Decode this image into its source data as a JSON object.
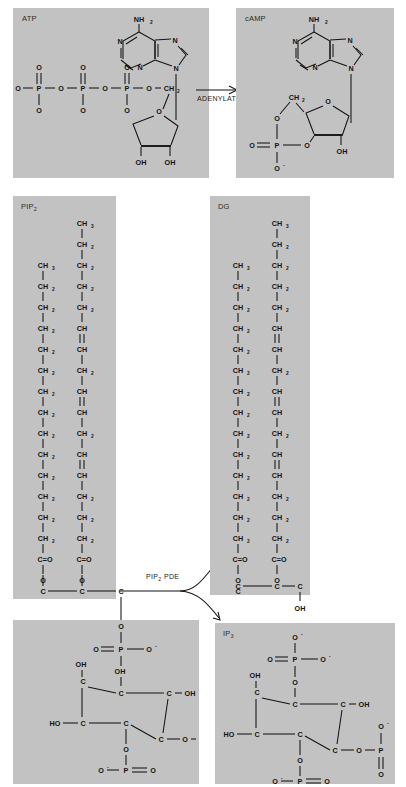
{
  "figure": {
    "background_color": "#ffffff",
    "panel_color": "#c2c2c2",
    "ink_color": "#131313"
  },
  "panels": [
    {
      "id": "atp",
      "label": "ATP",
      "label_sub": "",
      "molecule": "adenosine triphosphate"
    },
    {
      "id": "camp",
      "label": "cAMP",
      "label_sub": "",
      "molecule": "cyclic adenosine monophosphate"
    },
    {
      "id": "pip2",
      "label": "PIP",
      "label_sub": "2",
      "molecule": "phosphatidylinositol 4,5-bisphosphate"
    },
    {
      "id": "dg",
      "label": "DG",
      "label_sub": "",
      "molecule": "diacylglycerol"
    },
    {
      "id": "ip3",
      "label": "IP",
      "label_sub": "3",
      "molecule": "inositol 1,4,5-trisphosphate"
    }
  ],
  "reactions": [
    {
      "id": "cyclase",
      "enzyme": "ADENYLATE CYCLASE",
      "enzyme_sub": "",
      "arrow": "straight",
      "from": "ATP",
      "to": "cAMP"
    },
    {
      "id": "pde",
      "enzyme_pre": "PIP",
      "enzyme_sub": "2",
      "enzyme_post": " PDE",
      "arrow": "branched",
      "from": "PIP2",
      "to": "DG + IP3"
    }
  ],
  "atoms": {
    "nh2": "NH",
    "nh2_sub": "2",
    "n": "N",
    "o": "O",
    "p": "P",
    "c": "C",
    "oh": "OH",
    "ho": "HO",
    "ch2": "CH",
    "ch2_sub": "2",
    "ch3": "CH",
    "ch3_sub": "3",
    "ch": "CH",
    "co": "C=O",
    "o_minus": "O",
    "minus": "-"
  },
  "chains": {
    "saturated": [
      "CH3",
      "CH2",
      "CH2",
      "CH2",
      "CH2",
      "CH2",
      "CH2",
      "CH2",
      "CH2",
      "CH2",
      "CH2",
      "CH2",
      "CH2",
      "CH2",
      "CH2",
      "CH2",
      "CH2",
      "CH2",
      "C=O"
    ],
    "unsaturated": [
      "CH3",
      "CH2",
      "CH2",
      "CH2",
      "CH",
      "CH",
      "CH2",
      "CH",
      "CH",
      "CH2",
      "CH",
      "CH",
      "CH2",
      "CH",
      "CH",
      "CH2",
      "CH2",
      "CH2",
      "C=O"
    ],
    "double_bond_positions": [
      4,
      7,
      10,
      13
    ]
  }
}
